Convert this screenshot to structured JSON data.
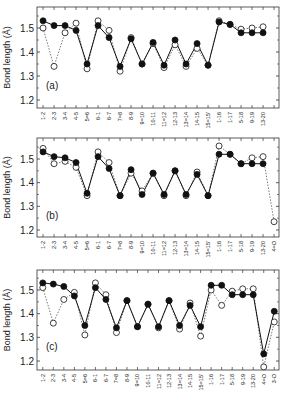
{
  "figure": {
    "ylabel": "Bond length (Å)",
    "yticks": [
      1.2,
      1.3,
      1.4,
      1.5
    ],
    "ylim": [
      1.16,
      1.56
    ]
  },
  "chart_data": [
    {
      "type": "line",
      "panel_label": "(a)",
      "xlabel": "",
      "ylabel": "Bond length (Å)",
      "ylim": [
        1.16,
        1.56
      ],
      "yticks": [
        1.2,
        1.3,
        1.4,
        1.5
      ],
      "grid": false,
      "categories": [
        "1-2",
        "2-3",
        "3-4",
        "4-5",
        "5=6",
        "6-1",
        "6-7",
        "7=8",
        "8-9",
        "9=10",
        "10-11",
        "11=12",
        "12-13",
        "13=14",
        "14-15",
        "15=15'",
        "1-16",
        "1-17",
        "5-18",
        "9-19",
        "13-20"
      ],
      "series": [
        {
          "name": "filled",
          "marker": "filled-circle",
          "line": "solid",
          "values": [
            1.53,
            1.51,
            1.51,
            1.49,
            1.35,
            1.51,
            1.46,
            1.34,
            1.455,
            1.35,
            1.44,
            1.345,
            1.45,
            1.35,
            1.435,
            1.345,
            1.525,
            1.515,
            1.48,
            1.48,
            1.48
          ]
        },
        {
          "name": "open",
          "marker": "open-circle",
          "line": "dotted",
          "values": [
            1.5,
            1.34,
            1.48,
            1.52,
            1.33,
            1.53,
            1.49,
            1.32,
            1.46,
            1.35,
            1.435,
            1.335,
            1.43,
            1.34,
            1.415,
            1.345,
            1.53,
            1.515,
            1.495,
            1.5,
            1.505
          ]
        }
      ]
    },
    {
      "type": "line",
      "panel_label": "(b)",
      "xlabel": "",
      "ylabel": "Bond length (Å)",
      "ylim": [
        1.16,
        1.56
      ],
      "yticks": [
        1.2,
        1.3,
        1.4,
        1.5
      ],
      "grid": false,
      "categories": [
        "1-2",
        "2-3",
        "3-4",
        "4-5",
        "5=6",
        "6-1",
        "6-7",
        "7=8",
        "8-9",
        "9=10",
        "10-11",
        "11=12",
        "12-13",
        "13=14",
        "14-15",
        "15=15'",
        "1-16",
        "1-17",
        "5-18",
        "9-19",
        "13-20",
        "4=O"
      ],
      "series": [
        {
          "name": "filled",
          "marker": "filled-circle",
          "line": "solid",
          "values": [
            1.53,
            1.51,
            1.505,
            1.485,
            1.355,
            1.51,
            1.46,
            1.345,
            1.455,
            1.35,
            1.44,
            1.35,
            1.45,
            1.35,
            1.435,
            1.345,
            1.52,
            1.52,
            1.48,
            1.48,
            1.48,
            null
          ]
        },
        {
          "name": "open",
          "marker": "open-circle",
          "line": "dotted",
          "values": [
            1.545,
            1.48,
            1.49,
            1.465,
            1.345,
            1.53,
            1.485,
            1.345,
            1.44,
            1.365,
            1.44,
            1.345,
            1.45,
            1.345,
            1.445,
            1.345,
            1.555,
            1.52,
            1.48,
            1.505,
            1.51,
            1.235
          ]
        }
      ]
    },
    {
      "type": "line",
      "panel_label": "(c)",
      "xlabel": "",
      "ylabel": "Bond length (Å)",
      "ylim": [
        1.16,
        1.56
      ],
      "yticks": [
        1.2,
        1.3,
        1.4,
        1.5
      ],
      "grid": false,
      "categories": [
        "1-2",
        "2-3",
        "3-4",
        "4-5",
        "5=6",
        "6-1",
        "6-7",
        "7=8",
        "8-9",
        "9=10",
        "10-11",
        "11=12",
        "12-13",
        "13=14",
        "14-15",
        "15=15'",
        "1-16",
        "1-17",
        "5-18",
        "9-19",
        "13-20",
        "4=O",
        "3-O"
      ],
      "series": [
        {
          "name": "filled",
          "marker": "filled-circle",
          "line": "solid",
          "values": [
            1.53,
            1.525,
            1.515,
            1.475,
            1.35,
            1.51,
            1.46,
            1.34,
            1.455,
            1.345,
            1.44,
            1.345,
            1.455,
            1.35,
            1.435,
            1.345,
            1.52,
            1.52,
            1.48,
            1.48,
            1.48,
            1.23,
            1.41
          ]
        },
        {
          "name": "open",
          "marker": "open-circle",
          "line": "dotted",
          "values": [
            1.51,
            1.36,
            1.46,
            1.49,
            1.31,
            1.53,
            1.48,
            1.32,
            1.455,
            1.345,
            1.44,
            1.34,
            1.455,
            1.335,
            1.445,
            1.305,
            1.5,
            1.435,
            1.495,
            1.505,
            1.505,
            1.175,
            1.365
          ]
        }
      ]
    }
  ],
  "layout": {
    "panels": [
      {
        "x0": 37,
        "x1": 279,
        "y_top": 7,
        "y_bottom": 108,
        "y15": 28,
        "y12": 100,
        "n_slots": 22
      },
      {
        "x0": 37,
        "x1": 279,
        "y_top": 138,
        "y_bottom": 237,
        "y15": 159,
        "y12": 230,
        "n_slots": 22
      },
      {
        "x0": 37,
        "x1": 279,
        "y_top": 270,
        "y_bottom": 370,
        "y15": 290,
        "y12": 361,
        "n_slots": 23
      }
    ]
  }
}
